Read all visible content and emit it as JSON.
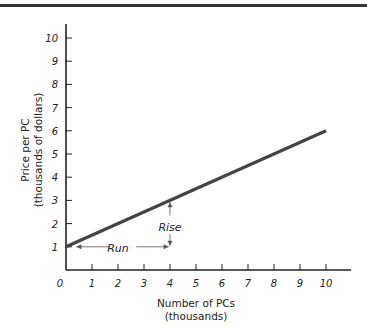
{
  "chart_data": {
    "type": "line",
    "title": "",
    "xlabel": "Number of PCs",
    "xlabel_sub": "(thousands)",
    "ylabel": "Price per PC",
    "ylabel_sub": "(thousands of dollars)",
    "xlim": [
      0,
      10
    ],
    "ylim": [
      0,
      10
    ],
    "x_ticks": [
      "0",
      "1",
      "2",
      "3",
      "4",
      "5",
      "6",
      "7",
      "8",
      "9",
      "10"
    ],
    "y_ticks": [
      "1",
      "2",
      "3",
      "4",
      "5",
      "6",
      "7",
      "8",
      "9",
      "10"
    ],
    "grid": false,
    "series": [
      {
        "name": "Price line",
        "x": [
          0,
          10
        ],
        "y": [
          1,
          6
        ],
        "color": "#444444"
      }
    ],
    "annotations": [
      {
        "text": "Run",
        "from": [
          0,
          1
        ],
        "to": [
          4,
          1
        ],
        "type": "horizontal-arrow"
      },
      {
        "text": "Rise",
        "from": [
          4,
          1
        ],
        "to": [
          4,
          3
        ],
        "type": "vertical-arrow"
      }
    ]
  },
  "labels": {
    "xlabel": "Number of PCs",
    "xlabel_sub": "(thousands)",
    "ylabel": "Price per PC",
    "ylabel_sub": "(thousands of dollars)",
    "run": "Run",
    "rise": "Rise"
  }
}
